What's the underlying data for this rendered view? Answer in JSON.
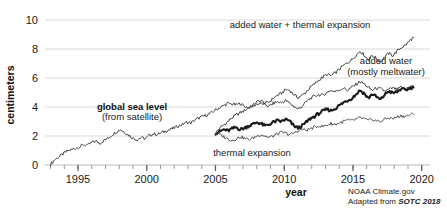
{
  "chart_data": {
    "type": "line",
    "title": "",
    "xlabel": "year",
    "ylabel": "centimeters",
    "xlim": [
      1992.6,
      2020.6
    ],
    "ylim": [
      0,
      10
    ],
    "grid": true,
    "legend_position": "inline-annotations",
    "xticks": [
      "1995",
      "2000",
      "2005",
      "2010",
      "2015",
      "2020"
    ],
    "xtick_values": [
      1995,
      2000,
      2005,
      2010,
      2015,
      2020
    ],
    "yticks": [
      "0",
      "2",
      "4",
      "6",
      "8",
      "10"
    ],
    "ytick_values": [
      0,
      2,
      4,
      6,
      8,
      10
    ],
    "minor_xtick_interval": 1,
    "annotations": [
      {
        "name": "global-sea-level",
        "line1": "global sea level",
        "line2": "(from satellite)"
      },
      {
        "name": "added-water-thermal",
        "line1": "added water + thermal expansion",
        "line2": ""
      },
      {
        "name": "added-water",
        "line1": "added water",
        "line2": "(mostly meltwater)"
      },
      {
        "name": "thermal-expansion",
        "line1": "thermal expansion",
        "line2": ""
      }
    ],
    "series": [
      {
        "name": "global sea level (from satellite)",
        "style": "thin",
        "color": "#3a3a3a",
        "x": [
          1993.0,
          1993.3,
          1993.6,
          1993.9,
          1994.2,
          1994.5,
          1994.8,
          1995.1,
          1995.4,
          1995.7,
          1996.0,
          1996.3,
          1996.6,
          1996.9,
          1997.2,
          1997.5,
          1997.8,
          1998.1,
          1998.4,
          1998.7,
          1999.0,
          1999.3,
          1999.6,
          1999.9,
          2000.2,
          2000.5,
          2000.8,
          2001.1,
          2001.4,
          2001.7,
          2002.0,
          2002.3,
          2002.6,
          2002.9,
          2003.2,
          2003.5,
          2003.8,
          2004.1,
          2004.4,
          2004.7,
          2005.0,
          2005.3,
          2005.6,
          2005.9,
          2006.2,
          2006.5,
          2006.8,
          2007.1,
          2007.4,
          2007.7,
          2008.0,
          2008.3,
          2008.6,
          2008.9,
          2009.2,
          2009.5,
          2009.8,
          2010.1,
          2010.4,
          2010.7,
          2011.0,
          2011.3,
          2011.6,
          2011.9,
          2012.2,
          2012.5,
          2012.8,
          2013.1,
          2013.4,
          2013.7,
          2014.0,
          2014.3,
          2014.6,
          2014.9,
          2015.2,
          2015.5,
          2015.8,
          2016.1,
          2016.4,
          2016.7,
          2017.0,
          2017.3,
          2017.6,
          2017.9,
          2018.2,
          2018.5,
          2018.8,
          2019.1,
          2019.4
        ],
        "y": [
          0.05,
          0.35,
          0.55,
          0.75,
          0.95,
          1.05,
          1.15,
          1.25,
          1.4,
          1.35,
          1.55,
          1.65,
          1.5,
          1.7,
          1.85,
          2.1,
          2.3,
          2.45,
          2.25,
          2.05,
          1.85,
          1.75,
          1.9,
          1.8,
          2.05,
          2.15,
          2.1,
          2.25,
          2.35,
          2.45,
          2.55,
          2.7,
          2.8,
          2.95,
          2.9,
          3.1,
          3.25,
          3.35,
          3.45,
          3.6,
          3.8,
          3.95,
          4.1,
          4.25,
          4.2,
          4.15,
          4.25,
          4.05,
          3.95,
          4.05,
          4.2,
          4.25,
          4.15,
          4.05,
          4.25,
          4.35,
          4.3,
          4.45,
          4.25,
          4.05,
          3.85,
          4.05,
          4.35,
          4.6,
          4.75,
          4.85,
          4.8,
          5.0,
          5.15,
          5.05,
          5.2,
          5.3,
          5.15,
          5.35,
          5.55,
          5.75,
          5.6,
          5.35,
          5.15,
          5.3,
          5.25,
          5.1,
          5.2,
          5.3,
          5.2,
          5.35,
          5.25,
          5.4,
          5.45
        ]
      },
      {
        "name": "added water + thermal expansion",
        "style": "thin",
        "color": "#3a3a3a",
        "x": [
          2005.0,
          2005.3,
          2005.6,
          2005.9,
          2006.2,
          2006.5,
          2006.8,
          2007.1,
          2007.4,
          2007.7,
          2008.0,
          2008.3,
          2008.6,
          2008.9,
          2009.2,
          2009.5,
          2009.8,
          2010.1,
          2010.4,
          2010.7,
          2011.0,
          2011.3,
          2011.6,
          2011.9,
          2012.2,
          2012.5,
          2012.8,
          2013.1,
          2013.4,
          2013.7,
          2014.0,
          2014.3,
          2014.6,
          2014.9,
          2015.2,
          2015.5,
          2015.8,
          2016.1,
          2016.4,
          2016.7,
          2017.0,
          2017.3,
          2017.6,
          2017.9,
          2018.2,
          2018.5,
          2018.8,
          2019.1,
          2019.4
        ],
        "y": [
          2.2,
          2.55,
          2.75,
          3.0,
          3.25,
          3.45,
          3.6,
          3.75,
          3.95,
          4.1,
          4.35,
          4.45,
          4.25,
          4.35,
          4.6,
          4.8,
          4.95,
          5.2,
          5.15,
          4.85,
          4.65,
          4.8,
          5.05,
          5.35,
          5.6,
          5.85,
          6.05,
          6.25,
          6.15,
          6.35,
          6.6,
          6.85,
          7.05,
          7.25,
          7.55,
          7.85,
          7.6,
          7.25,
          7.55,
          7.35,
          7.1,
          7.45,
          7.7,
          7.55,
          7.85,
          8.1,
          8.25,
          8.55,
          8.8
        ]
      },
      {
        "name": "added water (mostly meltwater)",
        "style": "bold",
        "color": "#1a1a1a",
        "x": [
          2005.0,
          2005.3,
          2005.6,
          2005.9,
          2006.2,
          2006.5,
          2006.8,
          2007.1,
          2007.4,
          2007.7,
          2008.0,
          2008.3,
          2008.6,
          2008.9,
          2009.2,
          2009.5,
          2009.8,
          2010.1,
          2010.4,
          2010.7,
          2011.0,
          2011.3,
          2011.6,
          2011.9,
          2012.2,
          2012.5,
          2012.8,
          2013.1,
          2013.4,
          2013.7,
          2014.0,
          2014.3,
          2014.6,
          2014.9,
          2015.2,
          2015.5,
          2015.8,
          2016.1,
          2016.4,
          2016.7,
          2017.0,
          2017.3,
          2017.6,
          2017.9,
          2018.2,
          2018.5,
          2018.8,
          2019.1,
          2019.4
        ],
        "y": [
          2.2,
          2.3,
          2.45,
          2.35,
          2.5,
          2.6,
          2.45,
          2.55,
          2.7,
          2.8,
          2.95,
          2.85,
          2.7,
          2.8,
          2.95,
          3.05,
          3.0,
          3.15,
          3.0,
          2.7,
          2.55,
          2.7,
          2.95,
          3.2,
          3.35,
          3.55,
          3.7,
          3.85,
          3.75,
          3.9,
          4.1,
          4.3,
          4.45,
          4.6,
          4.85,
          5.15,
          4.95,
          4.6,
          4.9,
          4.7,
          4.5,
          4.85,
          5.1,
          4.95,
          5.05,
          5.25,
          5.15,
          5.3,
          5.35
        ]
      },
      {
        "name": "thermal expansion",
        "style": "thin",
        "color": "#4a4a4a",
        "x": [
          2005.0,
          2005.3,
          2005.6,
          2005.9,
          2006.2,
          2006.5,
          2006.8,
          2007.1,
          2007.4,
          2007.7,
          2008.0,
          2008.3,
          2008.6,
          2008.9,
          2009.2,
          2009.5,
          2009.8,
          2010.1,
          2010.4,
          2010.7,
          2011.0,
          2011.3,
          2011.6,
          2011.9,
          2012.2,
          2012.5,
          2012.8,
          2013.1,
          2013.4,
          2013.7,
          2014.0,
          2014.3,
          2014.6,
          2014.9,
          2015.2,
          2015.5,
          2015.8,
          2016.1,
          2016.4,
          2016.7,
          2017.0,
          2017.3,
          2017.6,
          2017.9,
          2018.2,
          2018.5,
          2018.8,
          2019.1,
          2019.4
        ],
        "y": [
          2.2,
          2.1,
          1.95,
          1.8,
          1.7,
          1.8,
          1.95,
          1.85,
          1.75,
          1.85,
          2.0,
          2.1,
          2.0,
          1.9,
          2.0,
          2.15,
          2.25,
          2.2,
          2.1,
          2.2,
          2.35,
          2.45,
          2.4,
          2.5,
          2.6,
          2.7,
          2.65,
          2.75,
          2.85,
          2.8,
          2.9,
          3.0,
          3.1,
          3.05,
          3.15,
          3.25,
          3.2,
          3.05,
          3.15,
          3.05,
          3.0,
          3.15,
          3.25,
          3.2,
          3.3,
          3.4,
          3.35,
          3.45,
          3.5
        ]
      }
    ]
  },
  "credit": {
    "line1": "NOAA Climate.gov",
    "line2_prefix": "Adapted from ",
    "line2_source": "SOTC 2018"
  }
}
